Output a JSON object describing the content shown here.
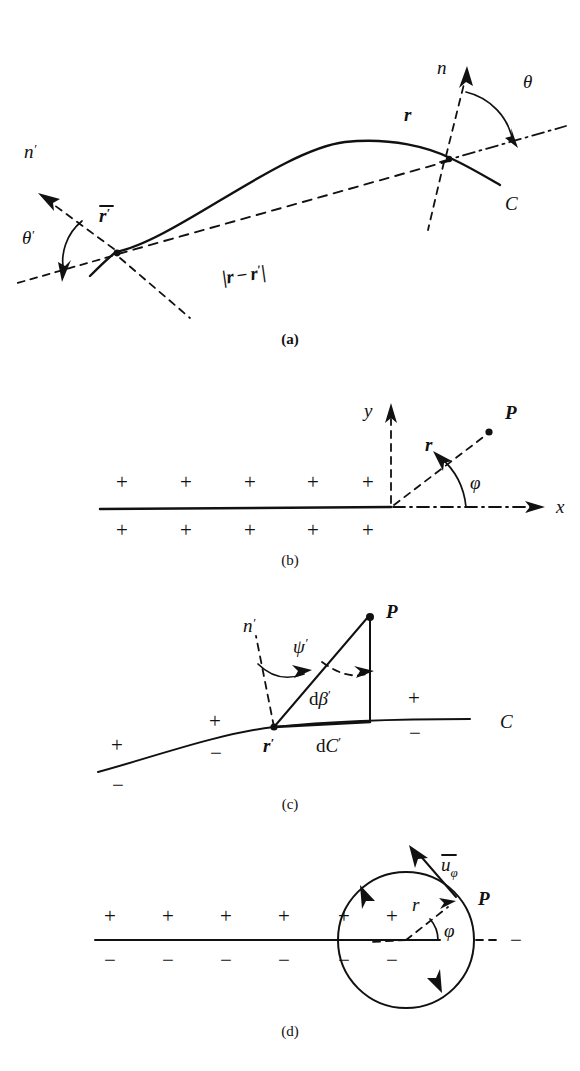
{
  "figure": {
    "ink_color": "#111111",
    "background_color": "#ffffff",
    "panel_count": 4
  },
  "panels": [
    {
      "id": "a",
      "caption": "(a)",
      "caption_bold": true,
      "description": "Curve C with field point r and source point r-bar-prime, outward normals n and n-prime, angles theta and theta-prime, and chord distance |r - r'|",
      "labels": {
        "normal_far": "n",
        "normal_near": "n",
        "normal_near_prime": "′",
        "angle_far": "θ",
        "angle_near": "θ",
        "angle_near_prime": "′",
        "point_far": "r",
        "point_near": "r",
        "point_near_prime": "′",
        "curve": "C",
        "distance": "|r − r′|",
        "distance_parts": {
          "open": "|",
          "r": "r",
          "minus": "−",
          "rprime": "r",
          "prime": "′",
          "close": "|"
        }
      }
    },
    {
      "id": "b",
      "caption": "(b)",
      "caption_bold": false,
      "description": "Semi-infinite sheet of positive sources along negative x axis with polar coordinates r, phi to field point P",
      "labels": {
        "axis_y": "y",
        "axis_x": "x",
        "radius": "r",
        "angle": "φ",
        "point": "P"
      },
      "signs": {
        "above_row": [
          "+",
          "+",
          "+",
          "+",
          "+"
        ],
        "below_row": [
          "+",
          "+",
          "+",
          "+",
          "+"
        ]
      }
    },
    {
      "id": "c",
      "caption": "(c)",
      "caption_bold": false,
      "description": "Element dC' of curve C at source point r' seen from field point P, subtending angle d-beta-prime, with normal n' and angle psi'",
      "labels": {
        "normal": "n",
        "normal_prime": "′",
        "angle_psi": "ψ",
        "angle_psi_prime": "′",
        "point_P": "P",
        "source_point": "r",
        "source_point_prime": "′",
        "d_beta": "dβ′",
        "d_beta_parts": {
          "d": "d",
          "beta": "β",
          "prime": "′"
        },
        "d_element": "dC′",
        "d_element_parts": {
          "d": "d",
          "C": "C",
          "prime": "′"
        },
        "curve": "C"
      },
      "signs": {
        "above_curve": [
          "+",
          "+",
          "+"
        ],
        "below_curve": [
          "−",
          "−",
          "−"
        ]
      }
    },
    {
      "id": "d",
      "caption": "(d)",
      "caption_bold": false,
      "description": "Doublet / vortex sheet along a line with a circulation contour (circle) enclosing the sheet end, unit vector u-bar-phi tangent at P",
      "labels": {
        "unit_vector": "u",
        "unit_vector_sub": "φ",
        "point": "P",
        "radius": "r",
        "angle": "φ"
      },
      "signs": {
        "above_row": [
          "+",
          "+",
          "+",
          "+",
          "+",
          "+"
        ],
        "below_row": [
          "−",
          "−",
          "−",
          "−",
          "−",
          "−"
        ],
        "right_outside": "−"
      }
    }
  ]
}
